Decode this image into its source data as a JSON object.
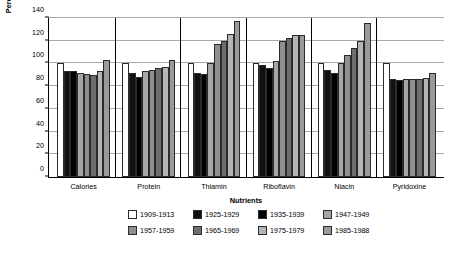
{
  "chart_data": {
    "type": "bar",
    "title": "",
    "xlabel": "Nutrients",
    "ylabel": "Percentage of 1909–1913 Values",
    "categories": [
      "Calories",
      "Protein",
      "Thiamin",
      "Riboflavin",
      "Niacin",
      "Pyridoxine"
    ],
    "ylim": [
      0,
      140
    ],
    "yticks": [
      0,
      20,
      40,
      60,
      80,
      100,
      120,
      140
    ],
    "grid": "horizontal",
    "legend_position": "bottom",
    "series": [
      {
        "name": "1909-1913",
        "color": "#ffffff",
        "values": [
          100,
          100,
          100,
          100,
          100,
          100
        ]
      },
      {
        "name": "1925-1929",
        "color": "#111111",
        "values": [
          93,
          92,
          92,
          99,
          94,
          86
        ]
      },
      {
        "name": "1935-1939",
        "color": "#000000",
        "values": [
          93,
          88,
          91,
          96,
          92,
          85
        ]
      },
      {
        "name": "1947-1949",
        "color": "#a6a6a6",
        "values": [
          92,
          93,
          100,
          102,
          100,
          86
        ]
      },
      {
        "name": "1957-1959",
        "color": "#8f8f8f",
        "values": [
          91,
          94,
          117,
          120,
          107,
          86
        ]
      },
      {
        "name": "1965-1969",
        "color": "#6e6e6e",
        "values": [
          90,
          96,
          120,
          122,
          114,
          86
        ]
      },
      {
        "name": "1975-1979",
        "color": "#b5b5b5",
        "values": [
          93,
          97,
          126,
          125,
          120,
          87
        ]
      },
      {
        "name": "1985-1988",
        "color": "#9a9a9a",
        "values": [
          103,
          103,
          137,
          125,
          136,
          92
        ]
      }
    ]
  }
}
